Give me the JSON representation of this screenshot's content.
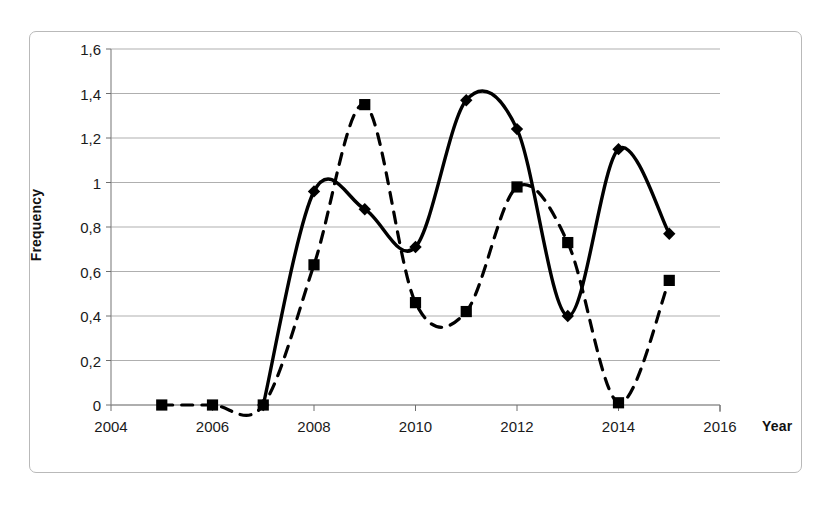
{
  "chart_data": {
    "type": "line",
    "title": "",
    "xlabel": "Year",
    "ylabel": "Frequency",
    "xlim": [
      2004,
      2016
    ],
    "ylim": [
      0,
      1.6
    ],
    "grid": "horizontal",
    "legend": "none",
    "decimal_separator": ",",
    "x_ticks": [
      "2004",
      "2006",
      "2008",
      "2010",
      "2012",
      "2014",
      "2016"
    ],
    "x_tick_values": [
      2004,
      2006,
      2008,
      2010,
      2012,
      2014,
      2016
    ],
    "y_ticks": [
      "0",
      "0,2",
      "0,4",
      "0,6",
      "0,8",
      "1",
      "1,2",
      "1,4",
      "1,6"
    ],
    "y_tick_values": [
      0,
      0.2,
      0.4,
      0.6,
      0.8,
      1.0,
      1.2,
      1.4,
      1.6
    ],
    "series": [
      {
        "name": "solid-diamond-series",
        "style": "solid",
        "marker": "diamond",
        "color": "#000000",
        "x": [
          2007,
          2008,
          2009,
          2010,
          2011,
          2012,
          2013,
          2014,
          2015
        ],
        "values": [
          0,
          0.96,
          0.88,
          0.71,
          1.37,
          1.24,
          0.4,
          1.15,
          0.77
        ]
      },
      {
        "name": "dashed-square-series",
        "style": "dashed",
        "marker": "square",
        "color": "#000000",
        "x": [
          2005,
          2006,
          2007,
          2008,
          2009,
          2010,
          2011,
          2012,
          2013,
          2014,
          2015
        ],
        "values": [
          0,
          0,
          0,
          0.63,
          1.35,
          0.46,
          0.42,
          0.98,
          0.73,
          0.01,
          0.56
        ]
      }
    ]
  },
  "axes": {
    "y_title": "Frequency",
    "x_title": "Year"
  }
}
